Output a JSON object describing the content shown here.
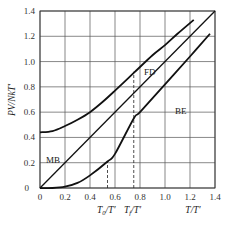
{
  "chart_data": {
    "type": "line",
    "title": "",
    "xlabel": "T/T'",
    "ylabel": "PV/NkT'",
    "xlim": [
      0,
      1.4
    ],
    "ylim": [
      0,
      1.4
    ],
    "grid": true,
    "x_ticks": [
      "0",
      "0.2",
      "0.4",
      "0.6",
      "0.8",
      "1.0",
      "1.2",
      "1.4"
    ],
    "y_ticks": [
      "0",
      "0.2",
      "0.4",
      "0.6",
      "0.8",
      "1.0",
      "1.2",
      "1.4"
    ],
    "series": [
      {
        "name": "MB",
        "x": [
          0,
          1.4
        ],
        "values": [
          0,
          1.4
        ]
      },
      {
        "name": "FD",
        "x": [
          0,
          0.1,
          0.2,
          0.3,
          0.4,
          0.5,
          0.6,
          0.75,
          0.9,
          1.0,
          1.1,
          1.23
        ],
        "values": [
          0.44,
          0.45,
          0.49,
          0.54,
          0.6,
          0.68,
          0.77,
          0.91,
          1.05,
          1.13,
          1.22,
          1.33
        ]
      },
      {
        "name": "BE",
        "x": [
          0,
          0.1,
          0.2,
          0.3,
          0.4,
          0.54,
          0.6,
          0.75,
          0.8,
          1.0,
          1.2,
          1.36
        ],
        "values": [
          0,
          0.0,
          0.01,
          0.04,
          0.1,
          0.21,
          0.27,
          0.55,
          0.6,
          0.82,
          1.04,
          1.22
        ]
      }
    ],
    "annotations": [
      {
        "text": "MB",
        "x": 0.06,
        "y": 0.23
      },
      {
        "text": "FD",
        "x": 0.86,
        "y": 0.93
      },
      {
        "text": "BE",
        "x": 1.09,
        "y": 0.6
      },
      {
        "text": "T0/T'",
        "x": 0.54,
        "type": "dashed-vline",
        "ymax": 0.21
      },
      {
        "text": "Tf/T'",
        "x": 0.75,
        "type": "dashed-vline",
        "ymax": 0.92
      }
    ]
  },
  "labels": {
    "ylabel": "PV/NkT′",
    "xlabel": "T/T′",
    "t0_label_main": "T",
    "t0_label_sub": "0",
    "t0_label_rest": "/T′",
    "tf_label_main": "T",
    "tf_label_sub": "f",
    "tf_label_rest": "/T′",
    "mb": "MB",
    "fd": "FD",
    "be": "BE",
    "origin": "0"
  }
}
